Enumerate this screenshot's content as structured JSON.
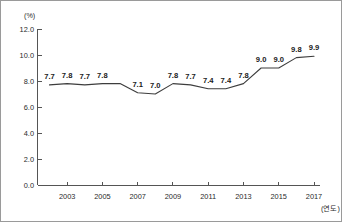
{
  "chart_data": {
    "type": "line",
    "title": "",
    "unit_label": "(%)",
    "xlabel": "(연도)",
    "ylabel": "",
    "x": [
      2002,
      2003,
      2004,
      2005,
      2006,
      2007,
      2008,
      2009,
      2010,
      2011,
      2012,
      2013,
      2014,
      2015,
      2016,
      2017
    ],
    "values": [
      7.7,
      7.8,
      7.7,
      7.8,
      7.8,
      7.1,
      7.0,
      7.8,
      7.7,
      7.4,
      7.4,
      7.8,
      9.0,
      9.0,
      9.8,
      9.9
    ],
    "point_labels": [
      "7.7",
      "7.8",
      "7.7",
      "7.8",
      "",
      "7.1",
      "7.0",
      "7.8",
      "7.7",
      "7.4",
      "7.4",
      "7.8",
      "9.0",
      "9.0",
      "9.8",
      "9.9"
    ],
    "ylim": [
      0.0,
      12.0
    ],
    "y_ticks": [
      "12.0",
      "10.0",
      "8.0",
      "6.0",
      "4.0",
      "2.0",
      "0.0"
    ],
    "y_tick_values": [
      12.0,
      10.0,
      8.0,
      6.0,
      4.0,
      2.0,
      0.0
    ],
    "x_ticks": [
      "2003",
      "2005",
      "2007",
      "2009",
      "2011",
      "2013",
      "2015",
      "2017"
    ],
    "x_tick_values": [
      2003,
      2005,
      2007,
      2009,
      2011,
      2013,
      2015,
      2017
    ],
    "grid": false,
    "legend": "none",
    "line_color": "#3d3d3d",
    "axis_color": "#555555",
    "background_color": "#ffffff"
  }
}
